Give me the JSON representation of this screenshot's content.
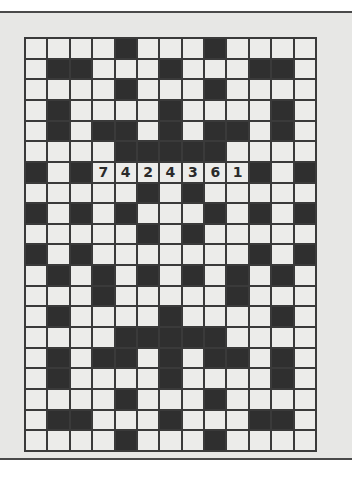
{
  "puzzle": {
    "type": "crossword-grid",
    "columns": 13,
    "rows": 20,
    "legend": {
      "#": "black-square",
      ".": "empty-white-square",
      "digit": "pre-filled number"
    },
    "grid": [
      "....#...#....",
      ".##...#...##.",
      "....#...#....",
      ".#....#....#.",
      ".#.##.#.##.#.",
      "....#####....",
      "#.#7424361#.#",
      ".....#.#.....",
      "#.#.#...#.#.#",
      ".....#.#.....",
      "#.#.......#.#",
      ".#.#.#.#.#.#.",
      "...#.....#...",
      ".#....#....#.",
      "....#####....",
      ".#.##.#.##.#.",
      ".#....#....#.",
      "....#...#....",
      ".##...#...##.",
      "....#...#...."
    ],
    "prefilled": {
      "row": 6,
      "start_col": 3,
      "digits": [
        "7",
        "4",
        "2",
        "4",
        "3",
        "6",
        "1"
      ]
    }
  },
  "colors": {
    "page_bg": "#ffffff",
    "panel_bg": "#e7e7e5",
    "rule": "#4a4a4a",
    "grid_line": "#3a3a3a",
    "white_cell": "#ececea",
    "black_cell": "#2f2f2f",
    "digit": "#2a2a2a"
  }
}
